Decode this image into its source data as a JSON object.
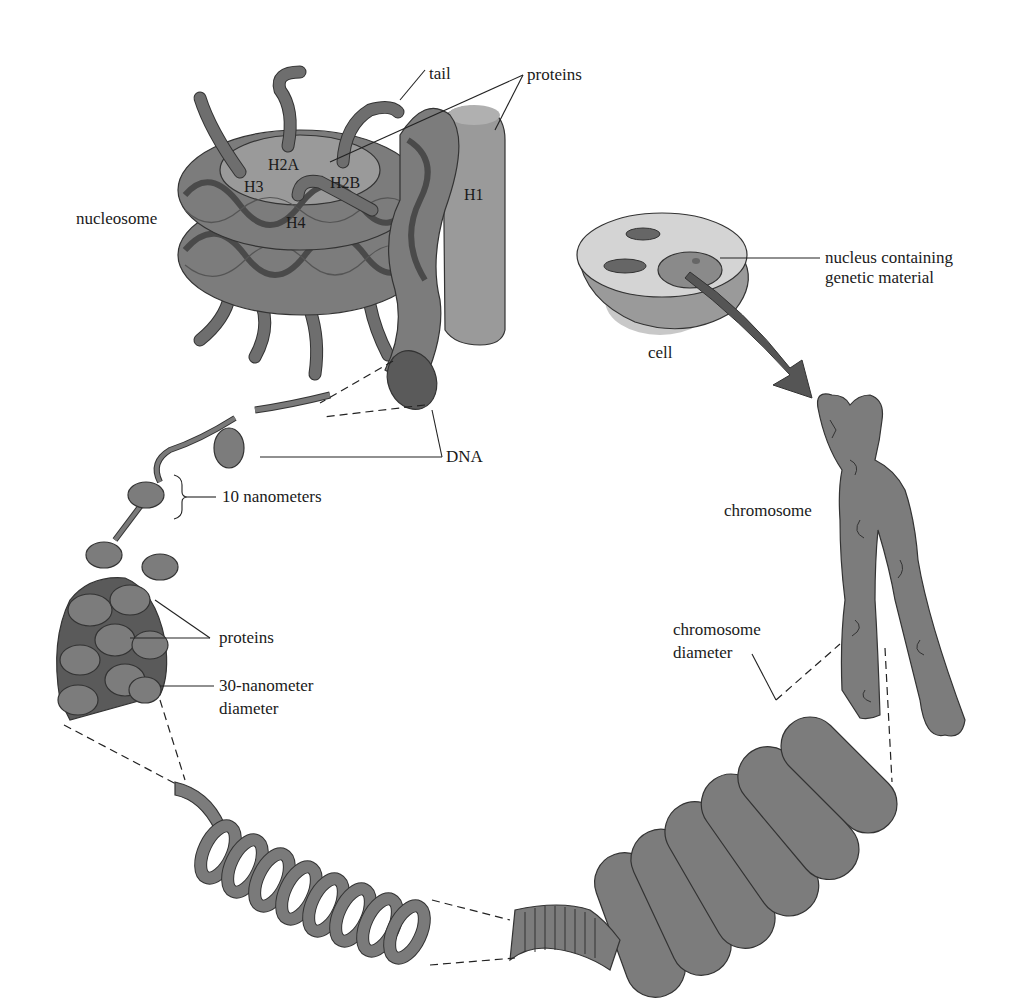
{
  "figure": {
    "type": "biology-illustration",
    "colors": {
      "background": "#ffffff",
      "structure_fill": "#7c7c7c",
      "structure_light": "#9a9a9a",
      "structure_dark": "#5a5a5a",
      "cell_fill": "#b8b8b8",
      "label_text": "#1a1a1a"
    }
  },
  "labels": {
    "tail": "tail",
    "proteins_top": "proteins",
    "h2a": "H2A",
    "h2b": "H2B",
    "h3": "H3",
    "h4": "H4",
    "h1": "H1",
    "nucleosome": "nucleosome",
    "nucleus_line1": "nucleus containing",
    "nucleus_line2": "genetic material",
    "cell": "cell",
    "dna": "DNA",
    "ten_nm": "10 nanometers",
    "chromosome": "chromosome",
    "proteins_mid": "proteins",
    "thirty_nm_line1": "30-nanometer",
    "thirty_nm_line2": "diameter",
    "chrom_diam_line1": "chromosome",
    "chrom_diam_line2": "diameter"
  }
}
